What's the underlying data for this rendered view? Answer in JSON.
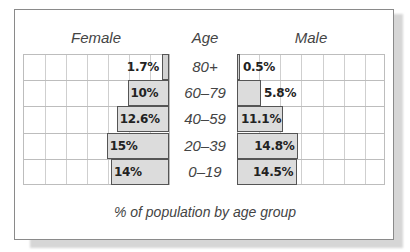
{
  "chart_data": {
    "type": "bar",
    "subtype": "population-pyramid",
    "title": "",
    "caption": "% of population by age group",
    "headers": {
      "left": "Female",
      "center": "Age",
      "right": "Male"
    },
    "categories": [
      "80+",
      "60–79",
      "40–59",
      "20–39",
      "0–19"
    ],
    "series": [
      {
        "name": "Female",
        "values": [
          1.7,
          10,
          12.6,
          15,
          14
        ],
        "labels": [
          "1.7%",
          "10%",
          "12.6%",
          "15%",
          "14%"
        ]
      },
      {
        "name": "Male",
        "values": [
          0.5,
          5.8,
          11.1,
          14.8,
          14.5
        ],
        "labels": [
          "0.5%",
          "5.8%",
          "11.1%",
          "14.8%",
          "14.5%"
        ]
      }
    ],
    "xlabel": "% of population by age group",
    "ylabel": "Age",
    "grid": true,
    "grid_columns_per_side": 7,
    "colors": {
      "bar_fill": "#dcdcdc",
      "bar_edge": "#555555",
      "grid": "#cfcfcf",
      "text": "#444444"
    }
  }
}
